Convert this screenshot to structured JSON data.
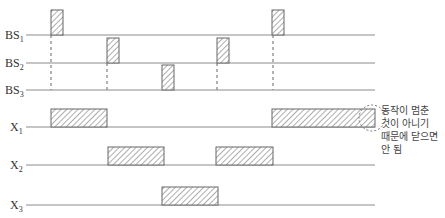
{
  "diagram": {
    "type": "timing-diagram",
    "colors": {
      "line": "#8c8c8c",
      "pulse_border": "#666666",
      "hatch": "#777777",
      "dash": "#666666",
      "circle": "#777777",
      "text": "#333333"
    },
    "signals": [
      {
        "name": "BS",
        "sub": "1",
        "y": 35,
        "height": 25,
        "pulses": [
          [
            51,
            63
          ],
          [
            272,
            284
          ]
        ]
      },
      {
        "name": "BS",
        "sub": "2",
        "y": 63,
        "height": 25,
        "pulses": [
          [
            107,
            119
          ],
          [
            217,
            229
          ]
        ]
      },
      {
        "name": "BS",
        "sub": "3",
        "y": 90,
        "height": 25,
        "pulses": [
          [
            162,
            174
          ]
        ]
      },
      {
        "name": "X",
        "sub": "1",
        "y": 127,
        "height": 18,
        "pulses": [
          [
            51,
            107
          ],
          [
            272,
            375
          ]
        ]
      },
      {
        "name": "X",
        "sub": "2",
        "y": 165,
        "height": 18,
        "pulses": [
          [
            108,
            164
          ],
          [
            216,
            273
          ]
        ]
      },
      {
        "name": "X",
        "sub": "3",
        "y": 205,
        "height": 18,
        "pulses": [
          [
            162,
            218
          ]
        ]
      }
    ],
    "line_start_x": 26,
    "line_end_x": 375,
    "dashed_guides": [
      {
        "x": 51,
        "y1": 35,
        "y2": 90
      },
      {
        "x": 107,
        "y1": 63,
        "y2": 90
      },
      {
        "x": 217,
        "y1": 63,
        "y2": 90
      },
      {
        "x": 273,
        "y1": 35,
        "y2": 90
      }
    ],
    "annotation": {
      "circle": {
        "cx": 372,
        "cy": 118,
        "r": 13
      },
      "text": "동작이 멈춘\n것이 아니기\n때문에 닫으면\n안 됨"
    }
  },
  "labels": {
    "bs1": "BS",
    "bs1_sub": "1",
    "bs2": "BS",
    "bs2_sub": "2",
    "bs3": "BS",
    "bs3_sub": "3",
    "x1": "X",
    "x1_sub": "1",
    "x2": "X",
    "x2_sub": "2",
    "x3": "X",
    "x3_sub": "3"
  }
}
